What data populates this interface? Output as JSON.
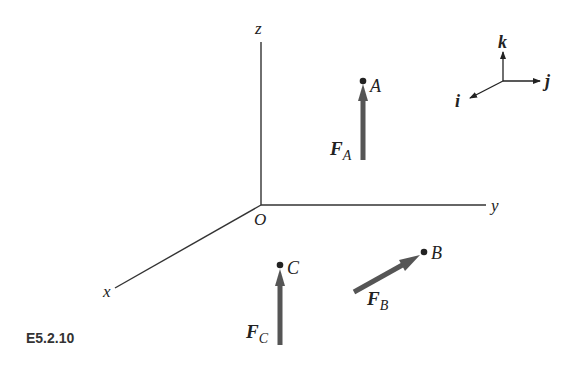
{
  "caption": "E5.2.10",
  "axes": {
    "x": "x",
    "y": "y",
    "z": "z",
    "origin": "O"
  },
  "unit_vectors": {
    "i": "i",
    "j": "j",
    "k": "k"
  },
  "points": {
    "A": "A",
    "B": "B",
    "C": "C"
  },
  "forces": {
    "FA": {
      "main": "F",
      "sub": "A"
    },
    "FB": {
      "main": "F",
      "sub": "B"
    },
    "FC": {
      "main": "F",
      "sub": "C"
    }
  },
  "colors": {
    "axis": "#333333",
    "force_arrow": "#555555",
    "point": "#222222"
  }
}
